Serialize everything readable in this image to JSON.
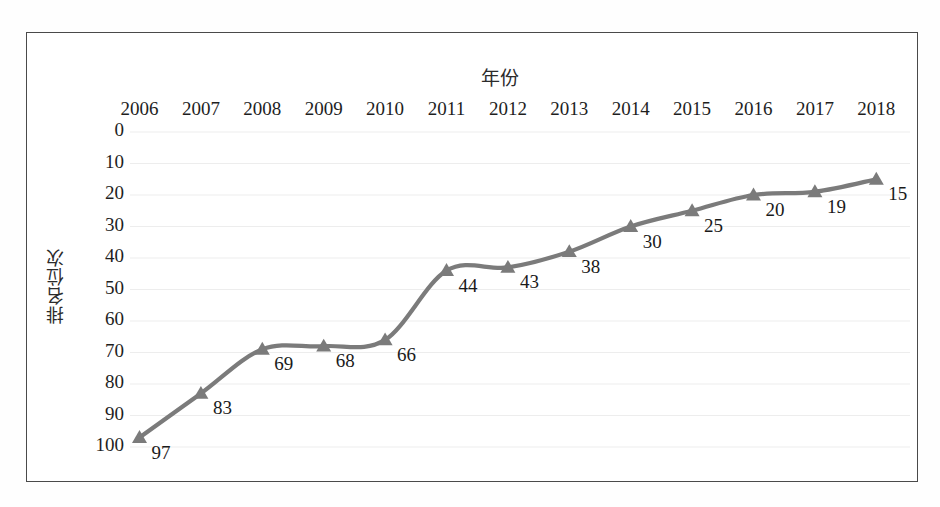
{
  "scan": {
    "top_clipped_text": " "
  },
  "chart_data": {
    "type": "line",
    "title": "",
    "xlabel": "年份",
    "ylabel": "排名位次",
    "categories": [
      "2006",
      "2007",
      "2008",
      "2009",
      "2010",
      "2011",
      "2012",
      "2013",
      "2014",
      "2015",
      "2016",
      "2017",
      "2018"
    ],
    "values": [
      97,
      83,
      69,
      68,
      66,
      44,
      43,
      38,
      30,
      25,
      20,
      19,
      15
    ],
    "point_labels": [
      "97",
      "83",
      "69",
      "68",
      "66",
      "44",
      "43",
      "38",
      "30",
      "25",
      "20",
      "19",
      "15"
    ],
    "ylim": [
      0,
      100
    ],
    "y_inverted": true,
    "y_ticks": [
      "0",
      "10",
      "20",
      "30",
      "40",
      "50",
      "60",
      "70",
      "80",
      "90",
      "100"
    ],
    "grid": true,
    "legend": "none",
    "series_color": "#7b7b7b",
    "marker": "triangle",
    "line_smooth": true
  },
  "style": {
    "frame_color": "#4a4a4a",
    "text_color": "#1a1a1a",
    "grid_color": "#ededed",
    "background": "#ffffff"
  }
}
